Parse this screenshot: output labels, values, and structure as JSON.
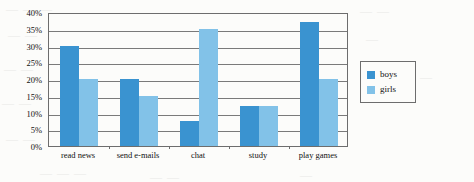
{
  "page": {
    "background_color": "#fcfcfa",
    "bleed_through_text": [
      "— — —",
      "—  —",
      "— —",
      "—",
      "— —",
      "—",
      "— —",
      "— —",
      "— — —",
      "—",
      "— —"
    ]
  },
  "chart_data": {
    "type": "bar",
    "title": "",
    "xlabel": "",
    "ylabel": "",
    "categories": [
      "read news",
      "send e-mails",
      "chat",
      "study",
      "play games"
    ],
    "series": [
      {
        "name": "boys",
        "color": "#3a93d0",
        "values": [
          30,
          20,
          7.5,
          12,
          37
        ]
      },
      {
        "name": "girls",
        "color": "#82c2e8",
        "values": [
          20,
          15,
          35,
          12,
          20
        ]
      }
    ],
    "ylim": [
      0,
      40
    ],
    "ytick_step": 5,
    "ytick_labels": [
      "40%",
      "35%",
      "30%",
      "25%",
      "20%",
      "15%",
      "10%",
      "5%",
      "0%"
    ],
    "ytick_values": [
      40,
      35,
      30,
      25,
      20,
      15,
      10,
      5,
      0
    ],
    "grid": true,
    "grid_color": "#7a7a7a",
    "axis_color": "#6d6d6d",
    "legend_position": "right"
  },
  "legend": {
    "entries": [
      {
        "label": "boys",
        "color": "#3a93d0"
      },
      {
        "label": "girls",
        "color": "#82c2e8"
      }
    ]
  }
}
